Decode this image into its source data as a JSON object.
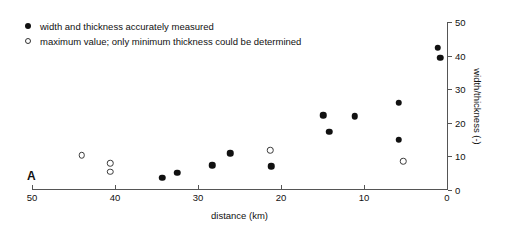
{
  "panel": {
    "label": "A"
  },
  "legend": {
    "entries": [
      {
        "marker": "filled-circle-icon",
        "label": "width and thickness accurately measured"
      },
      {
        "marker": "open-circle-icon",
        "label": "maximum value; only minimum thickness could be determined"
      }
    ]
  },
  "chart_data": {
    "type": "scatter",
    "title": "",
    "xlabel": "distance (km)",
    "ylabel": "width/thickness (-)",
    "xlim": [
      50,
      0
    ],
    "ylim": [
      0,
      50
    ],
    "x_reversed": true,
    "grid": false,
    "legend_position": "top-left",
    "y_axis_position": "right",
    "xticks": [
      50,
      40,
      30,
      20,
      10,
      0
    ],
    "xticklabels": [
      "50",
      "40",
      "30",
      "20",
      "10",
      "0"
    ],
    "yticks": [
      0,
      10,
      20,
      30,
      40,
      50
    ],
    "yticklabels": [
      "0",
      "10",
      "20",
      "30",
      "40",
      "50"
    ],
    "series": [
      {
        "name": "width and thickness accurately measured",
        "marker": "filled-circle",
        "points": [
          {
            "x": 34.3,
            "y": 3.6
          },
          {
            "x": 32.5,
            "y": 5.1
          },
          {
            "x": 28.3,
            "y": 7.4
          },
          {
            "x": 26.1,
            "y": 11.0
          },
          {
            "x": 21.2,
            "y": 7.1
          },
          {
            "x": 14.9,
            "y": 22.3
          },
          {
            "x": 14.2,
            "y": 17.3
          },
          {
            "x": 11.1,
            "y": 22.0
          },
          {
            "x": 5.8,
            "y": 25.9
          },
          {
            "x": 5.8,
            "y": 14.9
          },
          {
            "x": 1.1,
            "y": 42.3
          },
          {
            "x": 0.8,
            "y": 39.3
          }
        ]
      },
      {
        "name": "maximum value; only minimum thickness could be determined",
        "marker": "open-circle",
        "points": [
          {
            "x": 44.0,
            "y": 10.4
          },
          {
            "x": 40.6,
            "y": 8.0
          },
          {
            "x": 40.6,
            "y": 5.4
          },
          {
            "x": 21.3,
            "y": 11.9
          },
          {
            "x": 5.3,
            "y": 8.6
          }
        ]
      }
    ]
  }
}
